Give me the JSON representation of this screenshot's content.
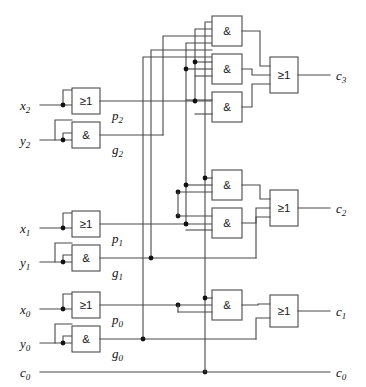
{
  "diagram": {
    "gate_symbols": {
      "or": "≥1",
      "and": "&"
    },
    "colors": {
      "wire": "#4a4a4a",
      "gate_fill": "#ffffff",
      "dot": "#111111",
      "text": "#111111"
    }
  },
  "inputs": [
    {
      "name": "x2",
      "base": "x",
      "sub": "2"
    },
    {
      "name": "y2",
      "base": "y",
      "sub": "2"
    },
    {
      "name": "x1",
      "base": "x",
      "sub": "1"
    },
    {
      "name": "y1",
      "base": "y",
      "sub": "1"
    },
    {
      "name": "x0",
      "base": "x",
      "sub": "0"
    },
    {
      "name": "y0",
      "base": "y",
      "sub": "0"
    },
    {
      "name": "c0",
      "base": "c",
      "sub": "0"
    }
  ],
  "intermediate": [
    {
      "name": "p2",
      "base": "p",
      "sub": "2"
    },
    {
      "name": "g2",
      "base": "g",
      "sub": "2"
    },
    {
      "name": "p1",
      "base": "p",
      "sub": "1"
    },
    {
      "name": "g1",
      "base": "g",
      "sub": "1"
    },
    {
      "name": "p0",
      "base": "p",
      "sub": "0"
    },
    {
      "name": "g0",
      "base": "g",
      "sub": "0"
    }
  ],
  "outputs": [
    {
      "name": "c3",
      "base": "c",
      "sub": "3"
    },
    {
      "name": "c2",
      "base": "c",
      "sub": "2"
    },
    {
      "name": "c1",
      "base": "c",
      "sub": "1"
    },
    {
      "name": "c0_out",
      "base": "c",
      "sub": "0"
    }
  ],
  "gates": {
    "bit2": {
      "or_label": "≥1",
      "and_label": "&"
    },
    "bit1": {
      "or_label": "≥1",
      "and_label": "&"
    },
    "bit0": {
      "or_label": "≥1",
      "and_label": "&"
    },
    "c3_and_a": "&",
    "c3_and_b": "&",
    "c3_and_c": "&",
    "c3_or": "≥1",
    "c2_and_a": "&",
    "c2_and_b": "&",
    "c2_or": "≥1",
    "c1_and": "&",
    "c1_or": "≥1"
  }
}
